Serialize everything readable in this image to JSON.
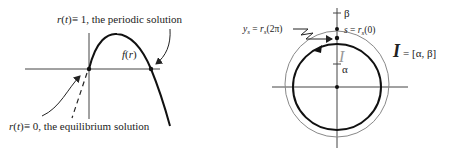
{
  "left_figure": {
    "top_label": "r(t) ≡ 1, the periodic solution",
    "top_label_parts": {
      "fn": "r",
      "arg": "t",
      "rest": "≡ 1, the periodic solution"
    },
    "bottom_label_parts": {
      "fn": "r",
      "arg": "t",
      "rest": "≡ 0, the equilibrium solution"
    },
    "curve_label": "f(r)",
    "curve_label_parts": {
      "fn": "f",
      "arg": "r"
    }
  },
  "right_figure": {
    "axis_top_label": "β",
    "axis_mid_label": "α",
    "interval_symbol": "I",
    "interval_label": "I",
    "interval_def": "= [α, β]",
    "s_label_parts": {
      "lhs": "s",
      "eq": " = ",
      "fn": "r",
      "sub": "s",
      "arg": "(0)"
    },
    "y_label_parts": {
      "lhs": "y",
      "lhs_sub": "s",
      "eq": " = ",
      "fn": "r",
      "sub": "s",
      "arg": "(2π)"
    }
  },
  "colors": {
    "ink": "#222222",
    "thin_circle": "#888888",
    "axis": "#444444"
  }
}
